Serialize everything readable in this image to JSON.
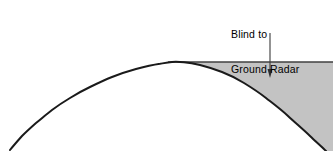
{
  "figure": {
    "title": "",
    "annotation": {
      "name": "blind-zone-callout",
      "line1": "Blind to",
      "line2": "Ground Radar",
      "text_x": 231,
      "text_y": 6,
      "font_size_px": 10.5
    },
    "arrow": {
      "name": "callout-arrow",
      "direction": "down",
      "x": 270,
      "y_start": 33,
      "y_end": 78,
      "head_width_px": 5,
      "head_length_px": 9,
      "color": "#3a3a3a"
    },
    "horizon_line": {
      "name": "radar-line-of-sight",
      "x_start": 168,
      "x_end": 333,
      "y": 62,
      "color": "#000000",
      "width_px": 1.2
    },
    "earth_curve": {
      "name": "earth-curvature-arc",
      "color": "#1a1a1a",
      "width_px": 2.0,
      "points": [
        [
          10,
          150
        ],
        [
          22,
          136
        ],
        [
          36,
          123
        ],
        [
          52,
          110
        ],
        [
          70,
          98
        ],
        [
          90,
          87
        ],
        [
          112,
          77
        ],
        [
          136,
          69
        ],
        [
          160,
          63
        ],
        [
          178,
          62
        ],
        [
          200,
          65
        ],
        [
          222,
          72
        ],
        [
          244,
          83
        ],
        [
          266,
          98
        ],
        [
          288,
          116
        ],
        [
          310,
          136
        ],
        [
          326,
          151
        ]
      ]
    },
    "shaded_region": {
      "name": "radar-blind-zone-fill",
      "fill": "#c3c3c3",
      "description": "Region between the radar line of sight and the earth curve"
    },
    "background_color": "#ffffff"
  },
  "chart_data": {
    "type": "area",
    "title": "Blind to Ground Radar",
    "xlabel": "",
    "ylabel": "",
    "xlim": [
      0,
      333
    ],
    "ylim": [
      151,
      0
    ],
    "grid": false,
    "legend": "none",
    "annotations": [
      {
        "text": "Blind to Ground Radar",
        "x": 270,
        "y": 20,
        "arrow_to_x": 270,
        "arrow_to_y": 78
      }
    ],
    "series": [
      {
        "name": "Earth Curvature",
        "type": "line",
        "x": [
          10,
          22,
          36,
          52,
          70,
          90,
          112,
          136,
          160,
          178,
          200,
          222,
          244,
          266,
          288,
          310,
          326
        ],
        "y": [
          150,
          136,
          123,
          110,
          98,
          87,
          77,
          69,
          63,
          62,
          65,
          72,
          83,
          98,
          116,
          136,
          151
        ]
      },
      {
        "name": "Radar Line of Sight",
        "type": "line",
        "x": [
          168,
          333
        ],
        "y": [
          62,
          62
        ]
      },
      {
        "name": "Blind Zone",
        "type": "area",
        "fill": "#c3c3c3",
        "x": [
          178,
          200,
          222,
          244,
          266,
          288,
          310,
          326,
          333,
          333
        ],
        "y": [
          62,
          65,
          72,
          83,
          98,
          116,
          136,
          151,
          151,
          62
        ]
      }
    ]
  }
}
